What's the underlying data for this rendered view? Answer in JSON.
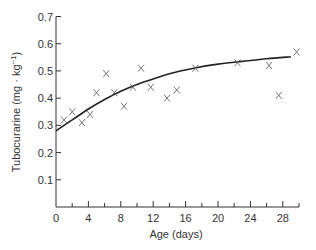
{
  "chart_data": {
    "type": "scatter",
    "title": "",
    "xlabel": "Age (days)",
    "ylabel": "Tubocurarine (mg · kg",
    "ylabel_superscript": "−1",
    "ylabel_close": ")",
    "xlim": [
      0,
      30
    ],
    "ylim": [
      0,
      0.7
    ],
    "x_ticks": [
      0,
      4,
      8,
      12,
      16,
      20,
      24,
      28
    ],
    "x_minor_ticks": [
      2,
      6,
      10,
      14,
      18,
      22,
      26,
      30
    ],
    "y_ticks": [
      0.1,
      0.2,
      0.3,
      0.4,
      0.5,
      0.6,
      0.7
    ],
    "y_tick_labels": [
      "0.1",
      "0.2",
      "0.3",
      "0.4",
      "0.5",
      "0.6",
      "0.7"
    ],
    "x_tick_labels": [
      "0",
      "4",
      "8",
      "12",
      "16",
      "20",
      "24",
      "28"
    ],
    "grid": false,
    "legend": null,
    "marker": "x",
    "points": [
      {
        "x": 1.0,
        "y": 0.32
      },
      {
        "x": 2.0,
        "y": 0.35
      },
      {
        "x": 3.2,
        "y": 0.31
      },
      {
        "x": 4.2,
        "y": 0.34
      },
      {
        "x": 5.0,
        "y": 0.42
      },
      {
        "x": 6.2,
        "y": 0.49
      },
      {
        "x": 7.2,
        "y": 0.42
      },
      {
        "x": 8.4,
        "y": 0.37
      },
      {
        "x": 9.5,
        "y": 0.44
      },
      {
        "x": 10.5,
        "y": 0.51
      },
      {
        "x": 11.7,
        "y": 0.44
      },
      {
        "x": 13.7,
        "y": 0.4
      },
      {
        "x": 14.9,
        "y": 0.43
      },
      {
        "x": 17.2,
        "y": 0.51
      },
      {
        "x": 22.4,
        "y": 0.53
      },
      {
        "x": 26.3,
        "y": 0.52
      },
      {
        "x": 27.5,
        "y": 0.41
      },
      {
        "x": 29.7,
        "y": 0.57
      }
    ],
    "fit_curve": [
      {
        "x": 0,
        "y": 0.28
      },
      {
        "x": 2,
        "y": 0.32
      },
      {
        "x": 4,
        "y": 0.36
      },
      {
        "x": 6,
        "y": 0.395
      },
      {
        "x": 8,
        "y": 0.425
      },
      {
        "x": 10,
        "y": 0.45
      },
      {
        "x": 12,
        "y": 0.47
      },
      {
        "x": 14,
        "y": 0.49
      },
      {
        "x": 17,
        "y": 0.51
      },
      {
        "x": 20,
        "y": 0.525
      },
      {
        "x": 23,
        "y": 0.535
      },
      {
        "x": 26,
        "y": 0.545
      },
      {
        "x": 29,
        "y": 0.552
      }
    ]
  },
  "colors": {
    "axis": "#333333",
    "marker": "#666666",
    "curve": "#222222"
  }
}
